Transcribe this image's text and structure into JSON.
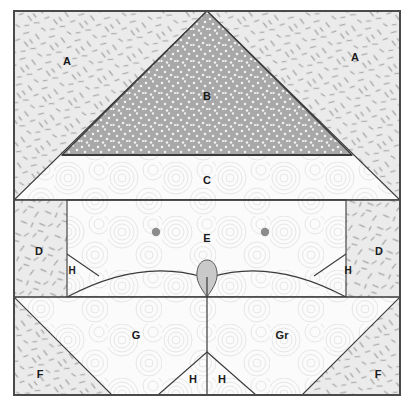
{
  "diagram": {
    "frame": {
      "x": 14,
      "y": 11,
      "width": 386,
      "height": 384
    },
    "colors": {
      "outline": "#3a3a3a",
      "frame_border": "#4a4a4a",
      "hatch_fill": "#ebebeb",
      "hatch_stroke": "#9a9a9a",
      "stipple_fill": "#a8a8a8",
      "stipple_dot": "#f0f0f0",
      "swirl_fill": "#fbfbfb",
      "swirl_stroke": "#e2e2e2",
      "plain_fill": "#f7f7f7",
      "marker_gray": "#8c8c8c",
      "teardrop_fill": "#c9c9c9"
    },
    "bands": [
      {
        "name": "upper-band",
        "y_top": 11,
        "y_bottom": 200
      },
      {
        "name": "middle-band",
        "y_top": 200,
        "y_bottom": 297
      },
      {
        "name": "lower-band",
        "y_top": 297,
        "y_bottom": 395
      }
    ],
    "labels": [
      {
        "id": "A-left",
        "text": "A",
        "x": 67,
        "y": 62,
        "region": "upper-left-hatch"
      },
      {
        "id": "A-right",
        "text": "A",
        "x": 355,
        "y": 58,
        "region": "upper-right-hatch"
      },
      {
        "id": "B",
        "text": "B",
        "x": 207,
        "y": 97,
        "region": "central-stipple-triangle"
      },
      {
        "id": "C",
        "text": "C",
        "x": 207,
        "y": 181,
        "region": "sub-triangle-swirl"
      },
      {
        "id": "D-left",
        "text": "D",
        "x": 39,
        "y": 252,
        "region": "middle-left-panel"
      },
      {
        "id": "D-right",
        "text": "D",
        "x": 379,
        "y": 252,
        "region": "middle-right-panel"
      },
      {
        "id": "E",
        "text": "E",
        "x": 207,
        "y": 239,
        "region": "middle-center-chamber"
      },
      {
        "id": "H-mid-left",
        "text": "H",
        "x": 72,
        "y": 271,
        "region": "middle-left-wedge"
      },
      {
        "id": "H-mid-right",
        "text": "H",
        "x": 348,
        "y": 271,
        "region": "middle-right-wedge"
      },
      {
        "id": "F-left",
        "text": "F",
        "x": 40,
        "y": 375,
        "region": "lower-left-hatch-triangle"
      },
      {
        "id": "F-right",
        "text": "F",
        "x": 378,
        "y": 375,
        "region": "lower-right-hatch-triangle"
      },
      {
        "id": "G",
        "text": "G",
        "x": 136,
        "y": 336,
        "region": "lower-left-swirl"
      },
      {
        "id": "Gr",
        "text": "Gr",
        "x": 282,
        "y": 336,
        "region": "lower-right-swirl"
      },
      {
        "id": "H-low-left",
        "text": "H",
        "x": 193,
        "y": 380,
        "region": "lower-center-wedge-left"
      },
      {
        "id": "H-low-right",
        "text": "H",
        "x": 222,
        "y": 380,
        "region": "lower-center-wedge-right"
      }
    ],
    "markers": [
      {
        "id": "dot-left",
        "x": 156,
        "y": 232,
        "r": 4.2,
        "color": "#8c8c8c"
      },
      {
        "id": "dot-right",
        "x": 265,
        "y": 232,
        "r": 4.2,
        "color": "#8c8c8c"
      }
    ],
    "teardrop": {
      "id": "center-teardrop",
      "x": 207,
      "y": 272,
      "color": "#c9c9c9"
    }
  }
}
